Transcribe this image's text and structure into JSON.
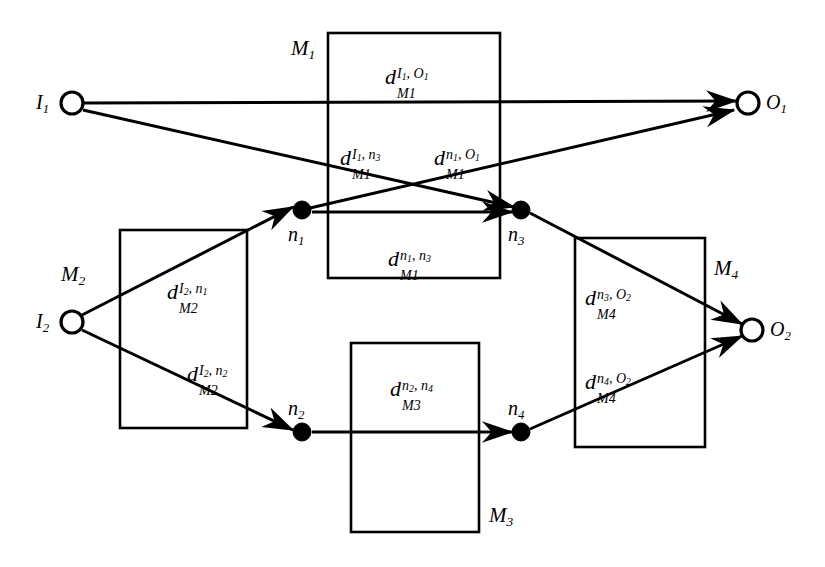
{
  "figure": {
    "type": "network-diagram",
    "background_color": "#ffffff",
    "stroke_color": "#000000"
  },
  "nodes": [
    {
      "id": "I1",
      "label": "I",
      "sub": "1",
      "kind": "open-circle",
      "x": 72,
      "y": 103,
      "r": 11,
      "label_x": 36,
      "label_y": 92
    },
    {
      "id": "I2",
      "label": "I",
      "sub": "2",
      "kind": "open-circle",
      "x": 72,
      "y": 322,
      "r": 11,
      "label_x": 36,
      "label_y": 311
    },
    {
      "id": "n1",
      "label": "n",
      "sub": "1",
      "kind": "filled-circle",
      "x": 302,
      "y": 210,
      "r": 9,
      "label_x": 288,
      "label_y": 224
    },
    {
      "id": "n2",
      "label": "n",
      "sub": "2",
      "kind": "filled-circle",
      "x": 302,
      "y": 432,
      "r": 9,
      "label_x": 288,
      "label_y": 398
    },
    {
      "id": "n3",
      "label": "n",
      "sub": "3",
      "kind": "filled-circle",
      "x": 521,
      "y": 210,
      "r": 9,
      "label_x": 508,
      "label_y": 224
    },
    {
      "id": "n4",
      "label": "n",
      "sub": "4",
      "kind": "filled-circle",
      "x": 521,
      "y": 432,
      "r": 9,
      "label_x": 508,
      "label_y": 398
    },
    {
      "id": "O1",
      "label": "O",
      "sub": "1",
      "kind": "open-circle",
      "x": 748,
      "y": 103,
      "r": 11,
      "label_x": 766,
      "label_y": 92
    },
    {
      "id": "O2",
      "label": "O",
      "sub": "2",
      "kind": "open-circle",
      "x": 752,
      "y": 330,
      "r": 11,
      "label_x": 770,
      "label_y": 319
    }
  ],
  "modules": [
    {
      "id": "M1",
      "label": "M",
      "sub": "1",
      "x": 328,
      "y": 33,
      "width": 172,
      "height": 245,
      "label_x": 291,
      "label_y": 38
    },
    {
      "id": "M2",
      "label": "M",
      "sub": "2",
      "x": 120,
      "y": 230,
      "width": 127,
      "height": 198,
      "label_x": 61,
      "label_y": 264
    },
    {
      "id": "M3",
      "label": "M",
      "sub": "3",
      "x": 351,
      "y": 343,
      "width": 128,
      "height": 189,
      "label_x": 489,
      "label_y": 505
    },
    {
      "id": "M4",
      "label": "M",
      "sub": "4",
      "x": 575,
      "y": 238,
      "width": 130,
      "height": 209,
      "label_x": 714,
      "label_y": 258
    }
  ],
  "edges": [
    {
      "id": "I1-O1",
      "from": "I1",
      "to": "O1",
      "x1": 84,
      "y1": 103,
      "x2": 736,
      "y2": 101,
      "arrow": true
    },
    {
      "id": "I1-n3",
      "from": "I1",
      "to": "n3",
      "x1": 83,
      "y1": 110,
      "x2": 514,
      "y2": 207,
      "arrow": true
    },
    {
      "id": "n1-O1",
      "from": "n1",
      "to": "O1",
      "x1": 310,
      "y1": 208,
      "x2": 734,
      "y2": 110,
      "arrow": true
    },
    {
      "id": "n1-n3",
      "from": "n1",
      "to": "n3",
      "x1": 312,
      "y1": 212,
      "x2": 512,
      "y2": 212,
      "arrow": true
    },
    {
      "id": "I2-n1",
      "from": "I2",
      "to": "n1",
      "x1": 82,
      "y1": 315,
      "x2": 293,
      "y2": 207,
      "arrow": true
    },
    {
      "id": "I2-n2",
      "from": "I2",
      "to": "n2",
      "x1": 82,
      "y1": 330,
      "x2": 293,
      "y2": 430,
      "arrow": true
    },
    {
      "id": "n2-n4",
      "from": "n2",
      "to": "n4",
      "x1": 312,
      "y1": 432,
      "x2": 512,
      "y2": 432,
      "arrow": true
    },
    {
      "id": "n3-O2",
      "from": "n3",
      "to": "O2",
      "x1": 530,
      "y1": 213,
      "x2": 742,
      "y2": 324,
      "arrow": true
    },
    {
      "id": "n4-O2",
      "from": "n4",
      "to": "O2",
      "x1": 530,
      "y1": 429,
      "x2": 742,
      "y2": 336,
      "arrow": true
    }
  ],
  "edge_labels": [
    {
      "id": "d-M1-I1-O1",
      "base": "d",
      "sup_a": "I",
      "sup_a_sub": "1",
      "sup_b": "O",
      "sup_b_sub": "1",
      "sub": "M1",
      "x": 385,
      "y": 66
    },
    {
      "id": "d-M1-I1-n3",
      "base": "d",
      "sup_a": "I",
      "sup_a_sub": "1",
      "sup_b": "n",
      "sup_b_sub": "3",
      "sub": "M1",
      "x": 340,
      "y": 147
    },
    {
      "id": "d-M1-n1-O1",
      "base": "d",
      "sup_a": "n",
      "sup_a_sub": "1",
      "sup_b": "O",
      "sup_b_sub": "1",
      "sub": "M1",
      "x": 434,
      "y": 147
    },
    {
      "id": "d-M1-n1-n3",
      "base": "d",
      "sup_a": "n",
      "sup_a_sub": "1",
      "sup_b": "n",
      "sup_b_sub": "3",
      "sub": "M1",
      "x": 388,
      "y": 248
    },
    {
      "id": "d-M2-I2-n1",
      "base": "d",
      "sup_a": "I",
      "sup_a_sub": "2",
      "sup_b": "n",
      "sup_b_sub": "1",
      "sub": "M2",
      "x": 167,
      "y": 281
    },
    {
      "id": "d-M2-I2-n2",
      "base": "d",
      "sup_a": "I",
      "sup_a_sub": "2",
      "sup_b": "n",
      "sup_b_sub": "2",
      "sub": "M2",
      "x": 187,
      "y": 363
    },
    {
      "id": "d-M3-n2-n4",
      "base": "d",
      "sup_a": "n",
      "sup_a_sub": "2",
      "sup_b": "n",
      "sup_b_sub": "4",
      "sub": "M3",
      "x": 390,
      "y": 378
    },
    {
      "id": "d-M4-n3-O2",
      "base": "d",
      "sup_a": "n",
      "sup_a_sub": "3",
      "sup_b": "O",
      "sup_b_sub": "2",
      "sub": "M4",
      "x": 585,
      "y": 287
    },
    {
      "id": "d-M4-n4-O2",
      "base": "d",
      "sup_a": "n",
      "sup_a_sub": "4",
      "sup_b": "O",
      "sup_b_sub": "2",
      "sub": "M4",
      "x": 585,
      "y": 371
    }
  ]
}
